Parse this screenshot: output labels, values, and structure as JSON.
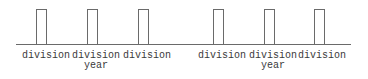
{
  "diagram": {
    "colors": {
      "line": "#6a6a6a",
      "text": "#3a3a3a",
      "background": "#ffffff"
    },
    "groups": [
      {
        "items": [
          {
            "label": "division",
            "sublabel": ""
          },
          {
            "label": "division",
            "sublabel": "year"
          },
          {
            "label": "division",
            "sublabel": ""
          }
        ]
      },
      {
        "items": [
          {
            "label": "division",
            "sublabel": ""
          },
          {
            "label": "division",
            "sublabel": "year"
          },
          {
            "label": "division",
            "sublabel": ""
          }
        ]
      }
    ]
  }
}
